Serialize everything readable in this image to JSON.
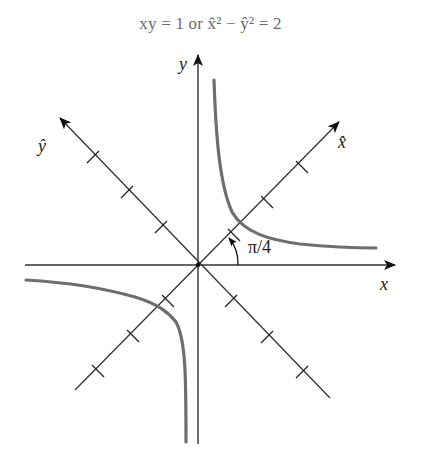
{
  "title": {
    "text": "xy = 1 or x̂² − ŷ² = 2",
    "lhs1": "xy = 1",
    "conj": "or",
    "rhs": "x̂² − ŷ² = 2"
  },
  "axes": {
    "x_label": "x",
    "y_label": "y",
    "x_hat_label": "x̂",
    "y_hat_label": "ŷ"
  },
  "annotations": {
    "angle_label": "π/4"
  },
  "colors": {
    "axis": "#333333",
    "hyperbola": "#6e6e6e",
    "title": "#6a6a6a"
  },
  "geometry": {
    "origin": [
      198,
      265
    ],
    "tick_spacing_px": 36,
    "ticks_per_diagonal_half": 3,
    "rotation_deg": 45
  }
}
